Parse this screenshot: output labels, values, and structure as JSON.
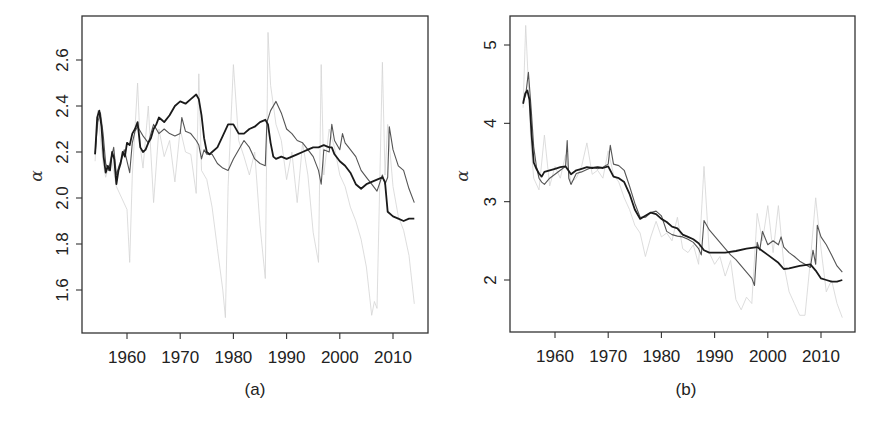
{
  "chart_data": [
    {
      "type": "line",
      "panel_label": "(a)",
      "title": "",
      "xlabel": "",
      "ylabel": "α",
      "xlim": [
        1952.8,
        2017.5
      ],
      "ylim": [
        1.44,
        2.76
      ],
      "xticks": [
        1960,
        1970,
        1980,
        1990,
        2000,
        2010
      ],
      "xtick_labels": [
        "1960",
        "1970",
        "1980",
        "1990",
        "2000",
        "2010"
      ],
      "yticks": [
        1.6,
        1.8,
        2.0,
        2.2,
        2.4,
        2.6
      ],
      "ytick_labels": [
        "1.6",
        "1.8",
        "2.0",
        "2.2",
        "2.4",
        "2.6"
      ],
      "grid": false,
      "legend": null,
      "series": [
        {
          "name": "dark",
          "color": "#1a1a1a",
          "width": 1.8,
          "x": [
            1954.0,
            1954.4,
            1954.8,
            1955.2,
            1955.6,
            1956.0,
            1956.4,
            1956.8,
            1957.2,
            1957.6,
            1958.0,
            1958.4,
            1958.8,
            1959.2,
            1959.6,
            1960.0,
            1960.5,
            1961.0,
            1961.5,
            1962.0,
            1962.5,
            1963.0,
            1963.5,
            1964.0,
            1964.5,
            1965.0,
            1965.5,
            1966.0,
            1966.5,
            1967.0,
            1968.0,
            1969.0,
            1970.0,
            1971.0,
            1972.0,
            1973.0,
            1973.5,
            1974.0,
            1974.5,
            1975.0,
            1975.5,
            1976.0,
            1977.0,
            1978.0,
            1979.0,
            1980.0,
            1981.0,
            1982.0,
            1983.0,
            1984.0,
            1985.0,
            1986.0,
            1986.5,
            1987.0,
            1987.5,
            1988.0,
            1989.0,
            1990.0,
            1991.0,
            1992.0,
            1993.0,
            1994.0,
            1995.0,
            1996.0,
            1997.0,
            1998.0,
            1998.5,
            1999.0,
            2000.0,
            2001.0,
            2002.0,
            2003.0,
            2004.0,
            2005.0,
            2006.0,
            2007.0,
            2008.0,
            2008.5,
            2009.0,
            2010.0,
            2011.0,
            2012.0,
            2013.0,
            2014.0
          ],
          "y": [
            2.19,
            2.35,
            2.38,
            2.31,
            2.18,
            2.11,
            2.14,
            2.12,
            2.2,
            2.17,
            2.06,
            2.12,
            2.15,
            2.2,
            2.18,
            2.24,
            2.23,
            2.28,
            2.3,
            2.33,
            2.22,
            2.2,
            2.21,
            2.24,
            2.26,
            2.3,
            2.32,
            2.35,
            2.34,
            2.33,
            2.36,
            2.4,
            2.42,
            2.41,
            2.43,
            2.45,
            2.43,
            2.36,
            2.26,
            2.2,
            2.19,
            2.2,
            2.22,
            2.27,
            2.32,
            2.32,
            2.28,
            2.28,
            2.3,
            2.31,
            2.33,
            2.34,
            2.32,
            2.24,
            2.18,
            2.17,
            2.18,
            2.17,
            2.18,
            2.19,
            2.2,
            2.21,
            2.22,
            2.22,
            2.23,
            2.22,
            2.22,
            2.19,
            2.16,
            2.14,
            2.11,
            2.06,
            2.04,
            2.06,
            2.07,
            2.08,
            2.09,
            2.07,
            1.94,
            1.92,
            1.91,
            1.9,
            1.91,
            1.91
          ]
        },
        {
          "name": "medium",
          "color": "#555555",
          "width": 1.1,
          "x": [
            1954.0,
            1954.5,
            1955.0,
            1955.5,
            1956.0,
            1956.5,
            1957.0,
            1957.5,
            1958.0,
            1958.5,
            1959.0,
            1959.5,
            1960.0,
            1960.5,
            1961.0,
            1961.5,
            1962.0,
            1962.5,
            1963.0,
            1964.0,
            1965.0,
            1966.0,
            1967.0,
            1968.0,
            1969.0,
            1970.0,
            1970.3,
            1971.0,
            1972.0,
            1973.0,
            1973.5,
            1974.0,
            1974.5,
            1975.0,
            1976.0,
            1977.0,
            1978.0,
            1979.0,
            1980.0,
            1981.0,
            1982.0,
            1983.0,
            1984.0,
            1985.0,
            1986.0,
            1986.3,
            1987.0,
            1988.0,
            1989.0,
            1990.0,
            1991.0,
            1992.0,
            1993.0,
            1994.0,
            1995.0,
            1996.0,
            1996.5,
            1997.0,
            1998.0,
            1998.5,
            1999.0,
            2000.0,
            2000.5,
            2001.0,
            2002.0,
            2003.0,
            2004.0,
            2005.0,
            2006.0,
            2007.0,
            2008.0,
            2008.5,
            2009.0,
            2009.3,
            2010.0,
            2011.0,
            2012.0,
            2013.0,
            2014.0
          ],
          "y": [
            2.19,
            2.33,
            2.37,
            2.28,
            2.15,
            2.12,
            2.17,
            2.22,
            2.1,
            2.14,
            2.17,
            2.21,
            2.16,
            2.11,
            2.24,
            2.29,
            2.31,
            2.29,
            2.27,
            2.24,
            2.32,
            2.28,
            2.3,
            2.28,
            2.27,
            2.28,
            2.35,
            2.29,
            2.28,
            2.25,
            2.23,
            2.17,
            2.21,
            2.19,
            2.19,
            2.15,
            2.13,
            2.12,
            2.17,
            2.21,
            2.25,
            2.22,
            2.17,
            2.15,
            2.14,
            2.33,
            2.38,
            2.42,
            2.37,
            2.3,
            2.28,
            2.25,
            2.24,
            2.21,
            2.18,
            2.12,
            2.06,
            2.21,
            2.2,
            2.32,
            2.25,
            2.21,
            2.28,
            2.24,
            2.21,
            2.18,
            2.12,
            2.09,
            2.06,
            2.03,
            2.1,
            2.06,
            2.09,
            2.31,
            2.21,
            2.14,
            2.12,
            2.04,
            1.98
          ]
        },
        {
          "name": "light",
          "color": "#d4d4d4",
          "width": 0.8,
          "x": [
            1954.0,
            1954.5,
            1955.0,
            1955.5,
            1956.0,
            1957.0,
            1958.0,
            1959.0,
            1960.0,
            1960.5,
            1961.0,
            1962.0,
            1962.5,
            1963.0,
            1964.0,
            1965.0,
            1966.0,
            1967.0,
            1968.0,
            1969.0,
            1970.0,
            1971.0,
            1972.0,
            1973.0,
            1973.5,
            1974.0,
            1975.0,
            1976.0,
            1977.0,
            1978.0,
            1978.5,
            1979.0,
            1980.0,
            1981.0,
            1982.0,
            1983.0,
            1984.0,
            1985.0,
            1986.0,
            1986.5,
            1987.0,
            1988.0,
            1989.0,
            1990.0,
            1991.0,
            1992.0,
            1993.0,
            1994.0,
            1995.0,
            1996.0,
            1996.5,
            1997.0,
            1998.0,
            1999.0,
            2000.0,
            2001.0,
            2002.0,
            2003.0,
            2004.0,
            2005.0,
            2006.0,
            2006.5,
            2007.0,
            2008.0,
            2008.5,
            2009.0,
            2010.0,
            2011.0,
            2012.0,
            2013.0,
            2014.0
          ],
          "y": [
            2.16,
            2.38,
            2.26,
            2.15,
            2.09,
            2.18,
            2.05,
            2.0,
            1.95,
            1.72,
            2.1,
            2.5,
            2.22,
            2.13,
            2.4,
            1.98,
            2.3,
            2.18,
            2.25,
            2.07,
            2.3,
            2.2,
            2.19,
            2.02,
            2.54,
            2.12,
            2.08,
            1.96,
            1.78,
            1.6,
            1.48,
            2.05,
            2.58,
            2.25,
            2.18,
            2.1,
            2.2,
            1.88,
            1.65,
            2.72,
            2.49,
            2.32,
            2.25,
            2.08,
            2.2,
            1.98,
            2.24,
            2.1,
            1.85,
            1.72,
            2.58,
            2.1,
            2.3,
            2.22,
            2.1,
            2.05,
            1.96,
            1.9,
            1.82,
            1.7,
            1.49,
            1.55,
            1.52,
            2.59,
            2.1,
            2.32,
            2.05,
            1.92,
            1.86,
            1.75,
            1.54
          ]
        }
      ]
    },
    {
      "type": "line",
      "panel_label": "(b)",
      "title": "",
      "xlabel": "",
      "ylabel": "α",
      "xlim": [
        1952.8,
        2017.5
      ],
      "ylim": [
        1.38,
        5.38
      ],
      "xticks": [
        1960,
        1970,
        1980,
        1990,
        2000,
        2010
      ],
      "xtick_labels": [
        "1960",
        "1970",
        "1980",
        "1990",
        "2000",
        "2010"
      ],
      "yticks": [
        2,
        3,
        4,
        5
      ],
      "ytick_labels": [
        "2",
        "3",
        "4",
        "5"
      ],
      "grid": false,
      "legend": null,
      "series": [
        {
          "name": "dark",
          "color": "#1a1a1a",
          "width": 1.8,
          "x": [
            1954.0,
            1954.4,
            1954.8,
            1955.2,
            1955.6,
            1956.0,
            1956.5,
            1957.0,
            1957.5,
            1958.0,
            1959.0,
            1960.0,
            1961.0,
            1962.0,
            1962.5,
            1963.0,
            1964.0,
            1965.0,
            1966.0,
            1967.0,
            1968.0,
            1969.0,
            1970.0,
            1971.0,
            1972.0,
            1973.0,
            1974.0,
            1975.0,
            1976.0,
            1977.0,
            1978.0,
            1979.0,
            1980.0,
            1981.0,
            1982.0,
            1983.0,
            1984.0,
            1985.0,
            1986.0,
            1987.0,
            1988.0,
            1989.0,
            1990.0,
            1992.0,
            1994.0,
            1996.0,
            1998.0,
            2000.0,
            2002.0,
            2003.0,
            2004.0,
            2006.0,
            2008.0,
            2009.0,
            2010.0,
            2011.0,
            2012.0,
            2013.0,
            2014.0
          ],
          "y": [
            4.25,
            4.38,
            4.42,
            4.3,
            3.85,
            3.5,
            3.42,
            3.36,
            3.32,
            3.38,
            3.4,
            3.42,
            3.44,
            3.45,
            3.4,
            3.35,
            3.4,
            3.42,
            3.44,
            3.43,
            3.44,
            3.43,
            3.45,
            3.32,
            3.3,
            3.25,
            3.1,
            2.9,
            2.78,
            2.82,
            2.86,
            2.84,
            2.78,
            2.74,
            2.68,
            2.66,
            2.58,
            2.55,
            2.52,
            2.47,
            2.38,
            2.35,
            2.35,
            2.35,
            2.37,
            2.4,
            2.42,
            2.32,
            2.22,
            2.14,
            2.15,
            2.18,
            2.2,
            2.12,
            2.02,
            2.0,
            1.98,
            1.98,
            2.0
          ]
        },
        {
          "name": "medium",
          "color": "#555555",
          "width": 1.1,
          "x": [
            1954.0,
            1954.5,
            1955.0,
            1955.5,
            1956.0,
            1956.5,
            1957.0,
            1957.5,
            1958.0,
            1959.0,
            1960.0,
            1961.0,
            1962.0,
            1962.3,
            1962.6,
            1963.0,
            1964.0,
            1965.0,
            1966.0,
            1967.0,
            1968.0,
            1969.0,
            1970.0,
            1970.4,
            1971.0,
            1972.0,
            1973.0,
            1974.0,
            1975.0,
            1976.0,
            1977.0,
            1978.0,
            1979.0,
            1980.0,
            1981.0,
            1982.0,
            1983.0,
            1984.0,
            1985.0,
            1986.0,
            1987.0,
            1987.5,
            1988.0,
            1989.0,
            1990.0,
            1991.0,
            1992.0,
            1993.0,
            1994.0,
            1995.0,
            1996.0,
            1997.0,
            1997.5,
            1998.0,
            1998.5,
            1999.0,
            2000.0,
            2001.0,
            2002.0,
            2002.5,
            2003.0,
            2004.0,
            2005.0,
            2006.0,
            2007.0,
            2008.0,
            2008.5,
            2009.0,
            2009.3,
            2010.0,
            2011.0,
            2012.0,
            2013.0,
            2014.0
          ],
          "y": [
            4.28,
            4.36,
            4.65,
            4.2,
            3.7,
            3.45,
            3.3,
            3.25,
            3.22,
            3.3,
            3.35,
            3.4,
            3.45,
            3.78,
            3.3,
            3.22,
            3.36,
            3.38,
            3.41,
            3.44,
            3.42,
            3.44,
            3.48,
            3.72,
            3.48,
            3.46,
            3.4,
            3.2,
            2.98,
            2.8,
            2.8,
            2.86,
            2.88,
            2.82,
            2.62,
            2.58,
            2.56,
            2.55,
            2.52,
            2.48,
            2.4,
            2.32,
            2.76,
            2.64,
            2.56,
            2.48,
            2.4,
            2.32,
            2.26,
            2.18,
            2.1,
            2.02,
            1.93,
            2.48,
            2.38,
            2.62,
            2.45,
            2.5,
            2.45,
            2.55,
            2.42,
            2.35,
            2.3,
            2.24,
            2.2,
            2.16,
            2.38,
            2.2,
            2.7,
            2.55,
            2.45,
            2.32,
            2.18,
            2.1
          ]
        },
        {
          "name": "light",
          "color": "#d4d4d4",
          "width": 0.8,
          "x": [
            1954.0,
            1954.5,
            1955.0,
            1955.5,
            1956.0,
            1957.0,
            1958.0,
            1959.0,
            1960.0,
            1961.0,
            1962.0,
            1963.0,
            1964.0,
            1965.0,
            1966.0,
            1967.0,
            1968.0,
            1969.0,
            1970.0,
            1971.0,
            1972.0,
            1973.0,
            1974.0,
            1975.0,
            1976.0,
            1977.0,
            1978.0,
            1979.0,
            1980.0,
            1981.0,
            1982.0,
            1983.0,
            1984.0,
            1985.0,
            1986.0,
            1987.0,
            1988.0,
            1989.0,
            1990.0,
            1991.0,
            1992.0,
            1993.0,
            1994.0,
            1995.0,
            1996.0,
            1997.0,
            1998.0,
            1999.0,
            2000.0,
            2001.0,
            2002.0,
            2003.0,
            2004.0,
            2005.0,
            2006.0,
            2007.0,
            2008.0,
            2009.0,
            2010.0,
            2011.0,
            2012.0,
            2013.0,
            2014.0
          ],
          "y": [
            4.2,
            5.25,
            4.5,
            3.7,
            3.3,
            3.15,
            3.85,
            3.2,
            3.45,
            3.3,
            3.6,
            3.25,
            3.3,
            3.45,
            3.75,
            3.35,
            3.4,
            3.3,
            3.65,
            3.35,
            3.25,
            3.05,
            2.9,
            2.7,
            2.6,
            2.3,
            2.55,
            2.75,
            2.55,
            2.6,
            2.5,
            2.8,
            2.4,
            2.35,
            2.45,
            2.2,
            3.45,
            2.35,
            2.2,
            2.3,
            2.05,
            2.25,
            1.75,
            1.62,
            1.78,
            1.7,
            2.85,
            2.5,
            2.95,
            2.35,
            2.95,
            2.2,
            1.85,
            1.7,
            1.55,
            1.55,
            2.25,
            3.05,
            2.4,
            1.85,
            2.0,
            1.7,
            1.52
          ]
        }
      ]
    }
  ]
}
